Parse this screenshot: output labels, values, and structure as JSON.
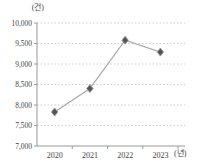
{
  "chart": {
    "y_unit_label": "(건)",
    "x_unit_label": "(년)"
  },
  "chart_data": {
    "type": "line",
    "title": "",
    "x": [
      "2020",
      "2021",
      "2022",
      "2023"
    ],
    "values": [
      7830,
      8400,
      9580,
      9290
    ],
    "xlabel": "(년)",
    "ylabel": "(건)",
    "ylim": [
      7000,
      10000
    ],
    "yticks": [
      7000,
      7500,
      8000,
      8500,
      9000,
      9500,
      10000
    ],
    "ytick_labels": [
      "7,000",
      "7,500",
      "8,000",
      "8,500",
      "9,000",
      "9,500",
      "10,000"
    ],
    "grid": "horizontal-dotted",
    "legend": "none",
    "marker": "diamond",
    "colors": {
      "line": "#aaaaaa",
      "marker": "#555555",
      "marker_stroke": "#999999",
      "grid": "#cccccc",
      "axis": "#999999",
      "text": "#444444"
    }
  }
}
